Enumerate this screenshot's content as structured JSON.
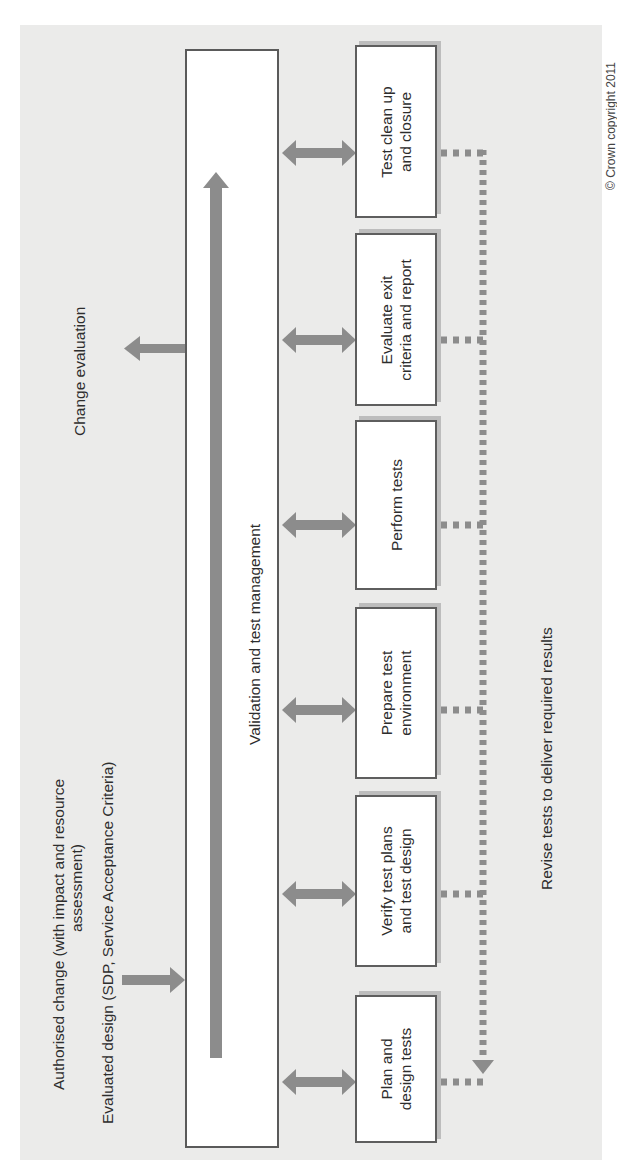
{
  "diagram": {
    "type": "process-flow",
    "orientation": "rotated-90-ccw",
    "colors": {
      "panel_background": "#ebebea",
      "arrow": "#8c8c8c",
      "box_border": "#5e5e5e",
      "box_fill": "#ffffff",
      "text": "#2d2d2d"
    },
    "inputs": {
      "authorised_change_line1": "Authorised change (with impact and resource",
      "authorised_change_line2": "assessment)",
      "evaluated_design": "Evaluated design (SDP, Service Acceptance Criteria)"
    },
    "output": {
      "change_evaluation": "Change evaluation"
    },
    "management_box": {
      "label": "Validation and test management"
    },
    "steps": [
      {
        "line1": "Plan and",
        "line2": "design tests"
      },
      {
        "line1": "Verify test plans",
        "line2": "and test design"
      },
      {
        "line1": "Prepare test",
        "line2": "environment"
      },
      {
        "line1": "Perform tests",
        "line2": ""
      },
      {
        "line1": "Evaluate exit",
        "line2": "criteria and report"
      },
      {
        "line1": "Test clean up",
        "line2": "and closure"
      }
    ],
    "feedback": {
      "label": "Revise tests to deliver required results"
    },
    "footer": {
      "copyright": "© Crown copyright 2011"
    }
  }
}
